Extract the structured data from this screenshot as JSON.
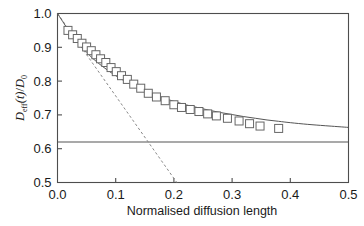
{
  "chart_data": {
    "type": "line",
    "title": "",
    "subtitle": "",
    "xlabel": "Normalised diffusion length",
    "ylabel": "Deff(t)/D0",
    "ylabel_parts": {
      "d": "D",
      "eff": "eff",
      "t": "(t)",
      "slash": "/",
      "d2": "D",
      "zero": "0"
    },
    "xlim": [
      0.0,
      0.5
    ],
    "ylim": [
      0.5,
      1.0
    ],
    "xticks": [
      0.0,
      0.1,
      0.2,
      0.3,
      0.4,
      0.5
    ],
    "yticks": [
      0.5,
      0.6,
      0.7,
      0.8,
      0.9,
      1.0
    ],
    "xticklabels": [
      "0.0",
      "0.1",
      "0.2",
      "0.3",
      "0.4",
      "0.5"
    ],
    "yticklabels": [
      "0.5",
      "0.6",
      "0.7",
      "0.8",
      "0.9",
      "1.0"
    ],
    "grid": false,
    "legend": "none",
    "tick_direction": "in",
    "frame": "box",
    "colors": {
      "axis": "#4d4d4d",
      "curve": "#555555",
      "marker_edge": "#666666",
      "marker_face": "#ffffff",
      "dashed": "#888888",
      "asymptote": "#555555",
      "text": "#1a1a1a",
      "background": "#ffffff"
    },
    "series": [
      {
        "name": "Deff(t)/D0 data",
        "style": "open-square-markers",
        "marker": "square",
        "x": [
          0.018,
          0.026,
          0.034,
          0.042,
          0.05,
          0.058,
          0.066,
          0.074,
          0.083,
          0.092,
          0.101,
          0.11,
          0.12,
          0.131,
          0.143,
          0.156,
          0.17,
          0.185,
          0.2,
          0.213,
          0.228,
          0.243,
          0.258,
          0.273,
          0.292,
          0.312,
          0.33,
          0.348,
          0.38
        ],
        "y": [
          0.95,
          0.937,
          0.926,
          0.912,
          0.901,
          0.89,
          0.878,
          0.866,
          0.855,
          0.84,
          0.828,
          0.816,
          0.805,
          0.791,
          0.779,
          0.764,
          0.753,
          0.742,
          0.73,
          0.722,
          0.716,
          0.71,
          0.703,
          0.697,
          0.69,
          0.682,
          0.674,
          0.667,
          0.66
        ]
      },
      {
        "name": "fitted curve",
        "style": "solid-line",
        "x": [
          0.0,
          0.02,
          0.04,
          0.06,
          0.08,
          0.1,
          0.12,
          0.14,
          0.16,
          0.18,
          0.2,
          0.22,
          0.24,
          0.26,
          0.28,
          0.3,
          0.32,
          0.34,
          0.36,
          0.38,
          0.4,
          0.43,
          0.46,
          0.5
        ],
        "y": [
          1.0,
          0.948,
          0.904,
          0.868,
          0.84,
          0.816,
          0.796,
          0.779,
          0.764,
          0.751,
          0.74,
          0.73,
          0.722,
          0.714,
          0.707,
          0.701,
          0.695,
          0.69,
          0.685,
          0.681,
          0.677,
          0.672,
          0.668,
          0.663
        ]
      },
      {
        "name": "short-time tangent",
        "style": "dashed-line",
        "x": [
          0.0,
          0.205
        ],
        "y": [
          1.0,
          0.5
        ]
      },
      {
        "name": "long-time asymptote",
        "style": "horizontal-solid-line",
        "value": 0.62,
        "x": [
          0.0,
          0.5
        ],
        "y": [
          0.62,
          0.62
        ]
      }
    ],
    "annotations": []
  }
}
